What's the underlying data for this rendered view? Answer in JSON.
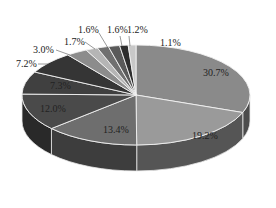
{
  "chart_data": {
    "type": "pie",
    "style": "3d-exploded-none",
    "title": "",
    "start_angle": "12 o'clock, clockwise",
    "categories": [
      "S1",
      "S2",
      "S3",
      "S4",
      "S5",
      "S6",
      "S7",
      "S8",
      "S9",
      "S10",
      "S11",
      "S12"
    ],
    "values": [
      30.7,
      19.2,
      13.4,
      12.0,
      7.3,
      7.2,
      3.0,
      1.7,
      1.6,
      1.6,
      1.2,
      1.1
    ],
    "labels": [
      "30.7%",
      "19.2%",
      "13.4%",
      "12.0%",
      "7.3%",
      "7.2%",
      "3.0%",
      "1.7%",
      "1.6%",
      "1.6%",
      "1.2%",
      "1.1%"
    ],
    "colors": [
      "#8a8a8a",
      "#9a9a9a",
      "#6e6e6e",
      "#4a4a4a",
      "#404040",
      "#353535",
      "#8c8c8c",
      "#b5b5b5",
      "#707070",
      "#5a5a5a",
      "#2e2e2e",
      "#c8c8c8"
    ],
    "legend": "none",
    "grid": false
  }
}
